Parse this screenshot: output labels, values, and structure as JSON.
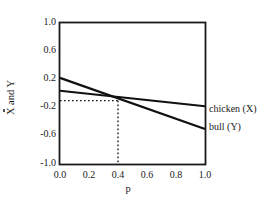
{
  "chart_data": {
    "type": "line",
    "title": "",
    "xlabel": "p",
    "ylabel": "X and Y",
    "xlim": [
      0.0,
      1.0
    ],
    "ylim": [
      -1.0,
      1.0
    ],
    "xticks": [
      "0.0",
      "0.2",
      "0.4",
      "0.6",
      "0.8",
      "1.0"
    ],
    "xtick_values": [
      0.0,
      0.2,
      0.4,
      0.6,
      0.8,
      1.0
    ],
    "yticks": [
      "1.0",
      "0.6",
      "0.2",
      "-0.2",
      "-0.6",
      "-1.0"
    ],
    "ytick_values": [
      1.0,
      0.6,
      0.2,
      -0.2,
      -0.6,
      -1.0
    ],
    "grid": false,
    "legend_position": "right-inline",
    "series": [
      {
        "name": "chicken (X)",
        "label": "chicken (X)",
        "x": [
          0.0,
          1.0
        ],
        "values": [
          0.04,
          -0.18
        ],
        "color": "#111111",
        "style": "solid"
      },
      {
        "name": "bull (Y)",
        "label": "bull (Y)",
        "x": [
          0.0,
          1.0
        ],
        "values": [
          0.22,
          -0.5
        ],
        "color": "#111111",
        "style": "solid"
      }
    ],
    "annotations": [
      {
        "name": "intersection-guide",
        "type": "dotted-crosshair",
        "x": 0.4,
        "y": -0.1,
        "style": "dotted",
        "color": "#111111"
      }
    ]
  }
}
